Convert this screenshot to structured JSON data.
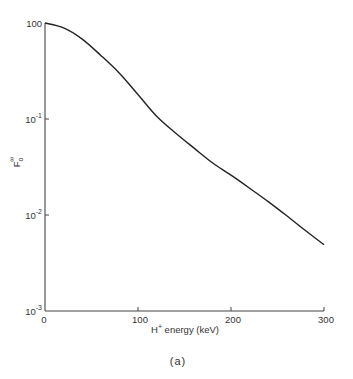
{
  "chart_data": {
    "type": "line",
    "title": "",
    "caption": "(a)",
    "xlabel": "H⁺ energy (keV)",
    "xlabel_base": "H",
    "xlabel_sup": "+",
    "xlabel_rest": " energy (keV)",
    "ylabel": "F₀^∞",
    "ylabel_base": "F",
    "ylabel_sub": "o",
    "ylabel_sup": "∞",
    "xlim": [
      0,
      300
    ],
    "ylim": [
      0.001,
      1
    ],
    "yscale": "log",
    "grid": false,
    "legend": null,
    "x_ticks": [
      {
        "value": 0,
        "label": "0"
      },
      {
        "value": 100,
        "label": "100"
      },
      {
        "value": 200,
        "label": "200"
      },
      {
        "value": 300,
        "label": "300"
      }
    ],
    "y_ticks": [
      {
        "value": 1,
        "base": "10",
        "exp": "0",
        "label": "100"
      },
      {
        "value": 0.1,
        "base": "10",
        "exp": "-1",
        "label": "10^-1"
      },
      {
        "value": 0.01,
        "base": "10",
        "exp": "-2",
        "label": "10^-2"
      },
      {
        "value": 0.001,
        "base": "10",
        "exp": "-3",
        "label": "10^-3"
      }
    ],
    "series": [
      {
        "name": "F0_inf",
        "color": "#222222",
        "x": [
          0,
          20,
          40,
          60,
          80,
          100,
          120,
          140,
          160,
          180,
          200,
          220,
          240,
          260,
          280,
          300
        ],
        "values": [
          1.0,
          0.89,
          0.68,
          0.46,
          0.3,
          0.18,
          0.107,
          0.072,
          0.05,
          0.035,
          0.026,
          0.019,
          0.0138,
          0.0098,
          0.0069,
          0.0049
        ]
      }
    ]
  },
  "layout": {
    "plot_left": 45,
    "plot_right": 324,
    "plot_top": 23,
    "plot_bottom": 311
  }
}
